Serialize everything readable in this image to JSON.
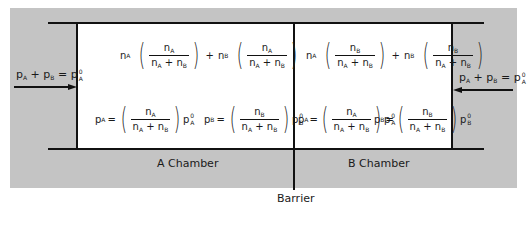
{
  "diagram": {
    "left_input": {
      "p_A": "p",
      "A": "A",
      "plus": "+",
      "p_B": "p",
      "B": "B",
      "equals": "=",
      "p0": "p",
      "sup": "0",
      "sub": "A"
    },
    "right_input": {
      "p_A": "p",
      "A": "A",
      "plus": "+",
      "p_B": "p",
      "B": "B",
      "equals": "=",
      "p0": "p",
      "sup": "0",
      "sub": "A"
    },
    "chamber_a": {
      "label": "A Chamber",
      "moles": {
        "n": "n",
        "A": "A",
        "B": "B",
        "plus": "+",
        "num_species": "A"
      },
      "pressure_a": {
        "p": "p",
        "sub": "A",
        "eq": "=",
        "num_species": "A",
        "p0_sub": "A",
        "p0_sup": "0"
      },
      "pressure_b": {
        "p": "p",
        "sub": "B",
        "eq": "=",
        "num_species": "B",
        "p0_sub": "B",
        "p0_sup": "0"
      }
    },
    "chamber_b": {
      "label": "B Chamber",
      "moles": {
        "num_species": "B"
      },
      "pressure_a": {
        "p": "p",
        "sub": "A",
        "eq": "=",
        "num_species": "A",
        "p0_sub": "A",
        "p0_sup": "0"
      },
      "pressure_b": {
        "p": "p",
        "sub": "B",
        "eq": "=",
        "num_species": "B",
        "p0_sub": "B",
        "p0_sup": "0"
      }
    },
    "barrier_label": "Barrier",
    "colors": {
      "background": "#c4c4c4",
      "chamber": "#ffffff",
      "lines": "#111111"
    }
  }
}
